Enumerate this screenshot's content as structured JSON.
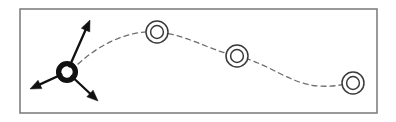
{
  "figure": {
    "title": "Particle trajectory with force vectors",
    "width": 396,
    "height": 122,
    "background_color": "#ffffff"
  },
  "frame": {
    "name": "figure-border",
    "x": 20,
    "y": 9,
    "width": 357,
    "height": 104,
    "stroke_color": "#808080",
    "stroke_width": 1.6,
    "fill_color": "#ffffff"
  },
  "colors": {
    "stroke_dark": "#111111",
    "stroke_mid": "#3a3a3a",
    "stroke_light": "#6e6e6e",
    "frame_gray": "#808080",
    "background": "#ffffff"
  },
  "particle": {
    "name": "source-particle",
    "label": "",
    "cx": 67,
    "cy": 72,
    "outer_radius": 11.5,
    "inner_radius": 5.2,
    "ring_stroke_width": 5.4,
    "ring_color": "#111111",
    "hole_color": "#ffffff"
  },
  "vectors": [
    {
      "name": "vector-up-right",
      "label": "",
      "from_x": 67,
      "from_y": 72,
      "to_x": 90,
      "to_y": 20,
      "color": "#111111",
      "stroke_width": 2.3,
      "arrowhead": true
    },
    {
      "name": "vector-down-left",
      "label": "",
      "from_x": 67,
      "from_y": 72,
      "to_x": 30,
      "to_y": 89,
      "color": "#111111",
      "stroke_width": 2.3,
      "arrowhead": true
    },
    {
      "name": "vector-down-right",
      "label": "",
      "from_x": 67,
      "from_y": 72,
      "to_x": 98,
      "to_y": 101,
      "color": "#111111",
      "stroke_width": 2.3,
      "arrowhead": true
    }
  ],
  "trajectory": {
    "name": "dashed-trajectory",
    "label": "",
    "path": "M 78 64 C 100 44, 128 30, 157 32 C 186 34, 208 50, 237 56 C 268 63, 290 84, 318 86 C 332 87, 342 85, 350 83",
    "color": "#6e6e6e",
    "stroke_width": 1.3,
    "dash_pattern": "5 4",
    "fill": "none"
  },
  "markers": [
    {
      "name": "trajectory-marker-1",
      "label": "",
      "cx": 157,
      "cy": 32,
      "outer_radius": 11,
      "inner_radius": 6.4,
      "stroke_color": "#3a3a3a",
      "stroke_width": 1.5,
      "fill_color": "#ffffff"
    },
    {
      "name": "trajectory-marker-2",
      "label": "",
      "cx": 237,
      "cy": 56,
      "outer_radius": 11,
      "inner_radius": 6.4,
      "stroke_color": "#3a3a3a",
      "stroke_width": 1.5,
      "fill_color": "#ffffff"
    },
    {
      "name": "trajectory-marker-3",
      "label": "",
      "cx": 353,
      "cy": 83,
      "outer_radius": 11,
      "inner_radius": 6.4,
      "stroke_color": "#3a3a3a",
      "stroke_width": 1.5,
      "fill_color": "#ffffff"
    }
  ]
}
